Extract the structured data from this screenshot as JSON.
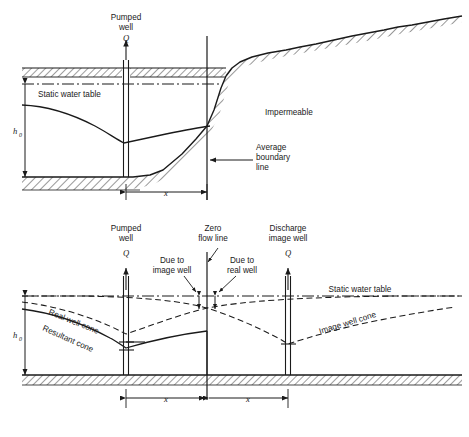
{
  "figure": {
    "type": "technical-cross-section-diagram",
    "panels": 2
  },
  "colors": {
    "line": "#1a1a1a",
    "hatch": "#1a1a1a",
    "background": "#ffffff",
    "text": "#1a1a1a"
  },
  "upper": {
    "labels": {
      "pumped_well_line1": "Pumped",
      "pumped_well_line2": "well",
      "discharge_q": "Q",
      "static_water_table": "Static water table",
      "impermeable": "Impermeable",
      "avg_boundary_line1": "Average",
      "avg_boundary_line2": "boundary",
      "avg_boundary_line3": "line",
      "h0": "h",
      "h0_sub": "0",
      "x_dim": "x"
    }
  },
  "lower": {
    "labels": {
      "pumped_well_line1": "Pumped",
      "pumped_well_line2": "well",
      "pumped_q": "Q",
      "zero_flow_line1": "Zero",
      "zero_flow_line2": "flow line",
      "discharge_image_line1": "Discharge",
      "discharge_image_line2": "image well",
      "image_q": "Q",
      "due_to_image_line1": "Due to",
      "due_to_image_line2": "image well",
      "due_to_real_line1": "Due to",
      "due_to_real_line2": "real well",
      "static_water_table": "Static water table",
      "real_well_cone": "Real well cone",
      "resultant_cone": "Resultant cone",
      "image_well_cone": "Image well cone",
      "h0": "h",
      "h0_sub": "0",
      "x_dim_left": "x",
      "x_dim_right": "x"
    }
  }
}
